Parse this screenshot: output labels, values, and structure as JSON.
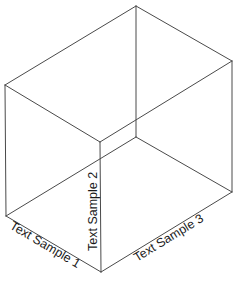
{
  "diagram": {
    "type": "isometric-box",
    "colors": {
      "stroke": "#4a4a4a",
      "text": "#1a1a1a",
      "background": "#ffffff"
    },
    "vertices": {
      "top_back": [
        136,
        6
      ],
      "top_left": [
        5,
        85
      ],
      "top_front": [
        100,
        142
      ],
      "top_right": [
        232,
        61
      ],
      "bottom_back": [
        136,
        137
      ],
      "bottom_left": [
        6,
        216
      ],
      "bottom_front": [
        101,
        272
      ],
      "bottom_right": [
        232,
        192
      ]
    },
    "labels": {
      "axis1": "Text Sample 1",
      "axis2": "Text Sample 2",
      "axis3": "Text Sample 3"
    }
  }
}
